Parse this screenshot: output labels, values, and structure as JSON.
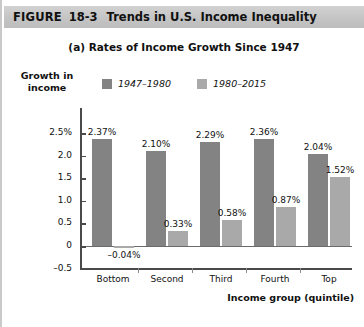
{
  "figure": {
    "label": "FIGURE",
    "number": "18-3",
    "title": "Trends in U.S. Income Inequality"
  },
  "panel": {
    "subtitle": "(a) Rates of Income Growth Since 1947"
  },
  "colors": {
    "series_1947_1980": "#838383",
    "series_1980_2015": "#a9a9a9",
    "header_band": "#c6c6c6",
    "axis": "#4a4a4a"
  },
  "chart_data": {
    "type": "bar",
    "title": "(a) Rates of Income Growth Since 1947",
    "xlabel": "Income group (quintile)",
    "ylabel": "Growth in income",
    "ylim": [
      -0.5,
      2.5
    ],
    "yticks": [
      2.5,
      2.0,
      1.5,
      1.0,
      0.5,
      0,
      -0.5
    ],
    "ytick_labels": [
      "2.5%",
      "2.0",
      "1.5",
      "1.0",
      "0.5",
      "0",
      "–0.5"
    ],
    "grid": false,
    "legend_position": "top-center",
    "categories": [
      "Bottom",
      "Second",
      "Third",
      "Fourth",
      "Top"
    ],
    "series": [
      {
        "name": "1947–1980",
        "color": "#838383",
        "values": [
          2.37,
          2.1,
          2.29,
          2.36,
          2.04
        ],
        "labels": [
          "2.37%",
          "2.10%",
          "2.29%",
          "2.36%",
          "2.04%"
        ]
      },
      {
        "name": "1980–2015",
        "color": "#a9a9a9",
        "values": [
          -0.04,
          0.33,
          0.58,
          0.87,
          1.52
        ],
        "labels": [
          "–0.04%",
          "0.33%",
          "0.58%",
          "0.87%",
          "1.52%"
        ]
      }
    ]
  }
}
